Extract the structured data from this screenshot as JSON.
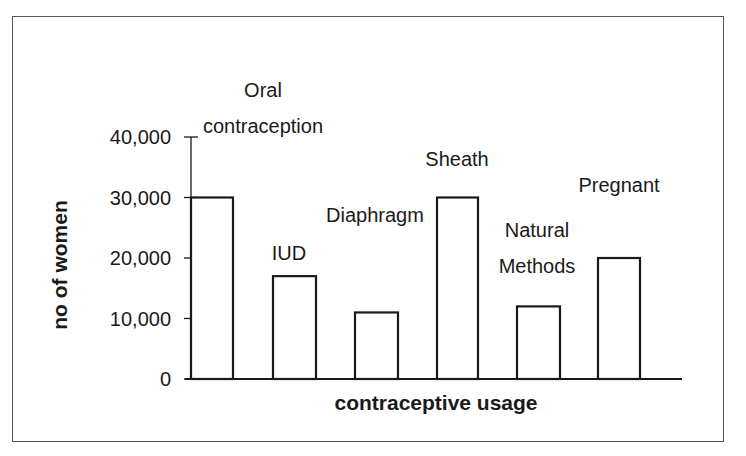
{
  "chart_data": {
    "type": "bar",
    "title": "",
    "xlabel": "contraceptive usage",
    "ylabel": "no of women",
    "categories": [
      "Oral contraception",
      "IUD",
      "Diaphragm",
      "Sheath",
      "Natural Methods",
      "Pregnant"
    ],
    "category_label_lines": [
      [
        "Oral",
        "contraception"
      ],
      [
        "IUD"
      ],
      [
        "Diaphragm"
      ],
      [
        "Sheath"
      ],
      [
        "Natural",
        "Methods"
      ],
      [
        "Pregnant"
      ]
    ],
    "values": [
      30000,
      17000,
      11000,
      30000,
      12000,
      20000
    ],
    "ylim": [
      0,
      40000
    ],
    "yticks": [
      0,
      10000,
      20000,
      30000,
      40000
    ],
    "ytick_labels": [
      "0",
      "10,000",
      "20,000",
      "30,000",
      "40,000"
    ],
    "grid": false,
    "legend": null,
    "bar_fill": "#ffffff",
    "bar_stroke": "#1a1a1a"
  }
}
